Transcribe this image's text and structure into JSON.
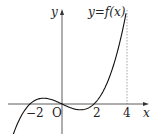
{
  "graph": {
    "function_label": "y=f(x)",
    "axis_x_label": "x",
    "axis_y_label": "y",
    "origin_label": "O",
    "tick_labels": [
      "−2",
      "2",
      "4"
    ],
    "dashed_line_at": "4",
    "curve": "cubic with roots at -2, 0, 2, rising to top at x=4"
  }
}
